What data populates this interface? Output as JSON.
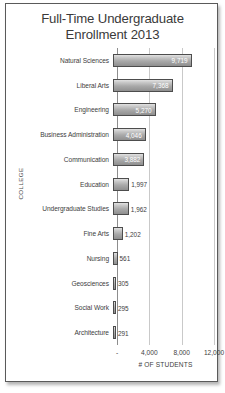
{
  "chart_data": {
    "type": "bar",
    "orientation": "horizontal",
    "title": "Full-Time Undergraduate\nEnrollment 2013",
    "xlabel": "# OF STUDENTS",
    "ylabel": "COLLEGE",
    "xlim": [
      0,
      12000
    ],
    "xticks": [
      0,
      4000,
      8000,
      12000
    ],
    "xtick_labels": [
      "-",
      "4,000",
      "8,000",
      "12,000"
    ],
    "grid": true,
    "legend": false,
    "categories": [
      "Natural Sciences",
      "Liberal Arts",
      "Engineering",
      "Business Administration",
      "Communication",
      "Education",
      "Undergraduate Studies",
      "Fine Arts",
      "Nursing",
      "Geosciences",
      "Social Work",
      "Architecture"
    ],
    "values": [
      9719,
      7368,
      5270,
      4046,
      3882,
      1997,
      1962,
      1202,
      561,
      305,
      295,
      291
    ],
    "value_labels": [
      "9,719",
      "7,368",
      "5,270",
      "4,046",
      "3,882",
      "1,997",
      "1,962",
      "1,202",
      "561",
      "305",
      "295",
      "291"
    ],
    "label_placement": [
      "inside",
      "inside",
      "inside",
      "inside",
      "inside",
      "outside",
      "outside",
      "outside",
      "outside",
      "outside",
      "outside",
      "outside"
    ],
    "colors": {
      "bar_fill_light": "#e2e2e2",
      "bar_fill_dark": "#8f8f8f",
      "bar_border": "#4d4d4d",
      "gridline": "#c9c9c9",
      "axis": "#8d8d8d",
      "text": "#3d3d3d",
      "title_text": "#3a3a3a",
      "inside_label_text": "#ffffff",
      "frame_border": "#5a5a5a",
      "background": "#ffffff"
    }
  }
}
